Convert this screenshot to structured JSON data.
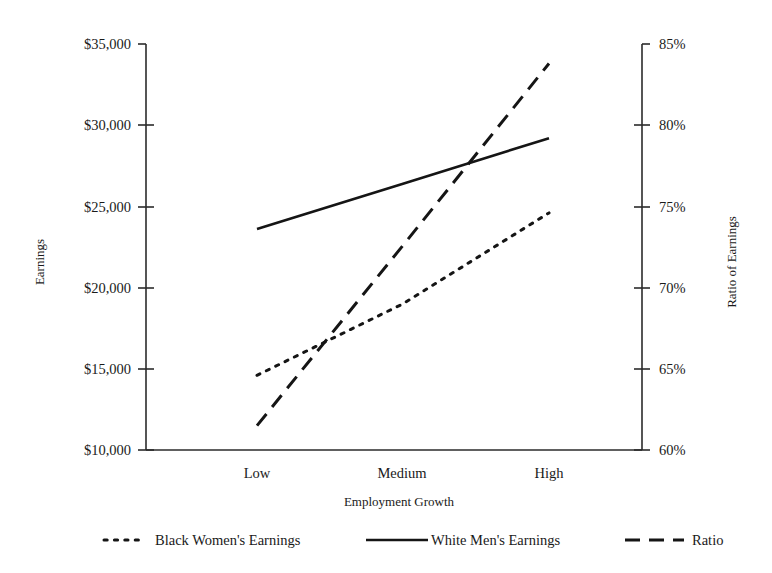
{
  "chart_data": {
    "type": "line",
    "title": "",
    "xlabel": "Employment Growth",
    "ylabel": "Earnings",
    "y2label": "Ratio of Earnings",
    "categories": [
      "Low",
      "Medium",
      "High"
    ],
    "ylim": [
      10000,
      35000
    ],
    "y2lim": [
      60,
      85
    ],
    "grid": false,
    "legend_position": "bottom",
    "yticks": [
      "$10,000",
      "$15,000",
      "$20,000",
      "$25,000",
      "$30,000",
      "$35,000"
    ],
    "ytick_values": [
      10000,
      15000,
      20000,
      25000,
      30000,
      35000
    ],
    "y2ticks": [
      "60%",
      "65%",
      "70%",
      "75%",
      "80%",
      "85%"
    ],
    "y2tick_values": [
      60,
      65,
      70,
      75,
      80,
      85
    ],
    "series": [
      {
        "name": "Black Women's Earnings",
        "axis": "left",
        "style": "dotted",
        "values": [
          14600,
          19000,
          24600
        ]
      },
      {
        "name": "White Men's Earnings",
        "axis": "left",
        "style": "solid",
        "values": [
          23600,
          26400,
          29200
        ]
      },
      {
        "name": "Ratio",
        "axis": "right",
        "style": "dashed",
        "values": [
          61.5,
          72.6,
          83.8
        ]
      }
    ]
  },
  "axes": {
    "left_title": "Earnings",
    "right_title": "Ratio of Earnings",
    "x_title": "Employment Growth",
    "left_ticks": [
      "$35,000",
      "$30,000",
      "$25,000",
      "$20,000",
      "$15,000",
      "$10,000"
    ],
    "right_ticks": [
      "85%",
      "80%",
      "75%",
      "70%",
      "65%",
      "60%"
    ],
    "categories": [
      "Low",
      "Medium",
      "High"
    ]
  },
  "legend": {
    "items": [
      {
        "label": "Black Women's Earnings",
        "style": "dotted"
      },
      {
        "label": "White Men's Earnings",
        "style": "solid"
      },
      {
        "label": "Ratio",
        "style": "dashed"
      }
    ]
  },
  "colors": {
    "ink": "#151515",
    "axis": "#2b2b2b",
    "background": "#ffffff"
  }
}
